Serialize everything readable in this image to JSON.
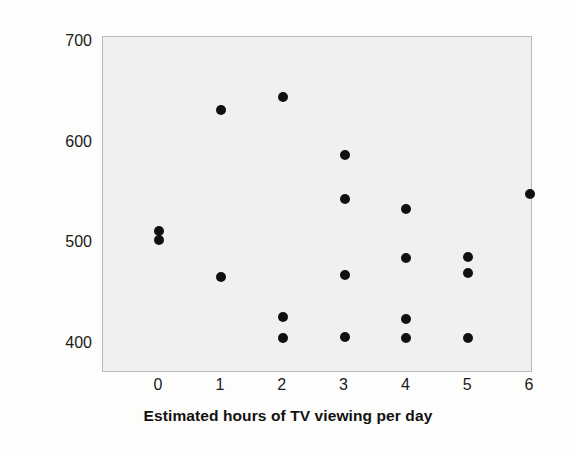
{
  "chart_data": {
    "type": "scatter",
    "title": "",
    "xlabel": "Estimated hours of TV viewing per day",
    "ylabel": "SAT score",
    "xlim": [
      -0.4,
      6.3
    ],
    "ylim": [
      370,
      700
    ],
    "grid": false,
    "legend": "none",
    "x_ticks": [
      "0",
      "1",
      "2",
      "3",
      "4",
      "5",
      "6"
    ],
    "x_tick_values": [
      0,
      1,
      2,
      3,
      4,
      5,
      6
    ],
    "y_ticks": [
      "700",
      "600",
      "500",
      "400"
    ],
    "y_tick_values": [
      700,
      600,
      500,
      400
    ],
    "marker": "filled-circle",
    "marker_color": "#101010",
    "plot_background": "#f0f0f0",
    "points": [
      {
        "x": 0,
        "y": 512
      },
      {
        "x": 0,
        "y": 503
      },
      {
        "x": 1,
        "y": 632
      },
      {
        "x": 1,
        "y": 467
      },
      {
        "x": 2,
        "y": 645
      },
      {
        "x": 2,
        "y": 427
      },
      {
        "x": 2,
        "y": 406
      },
      {
        "x": 3,
        "y": 588
      },
      {
        "x": 3,
        "y": 544
      },
      {
        "x": 3,
        "y": 469
      },
      {
        "x": 3,
        "y": 407
      },
      {
        "x": 4,
        "y": 534
      },
      {
        "x": 4,
        "y": 485
      },
      {
        "x": 4,
        "y": 425
      },
      {
        "x": 4,
        "y": 406
      },
      {
        "x": 5,
        "y": 486
      },
      {
        "x": 5,
        "y": 471
      },
      {
        "x": 5,
        "y": 406
      },
      {
        "x": 6,
        "y": 549
      }
    ]
  }
}
